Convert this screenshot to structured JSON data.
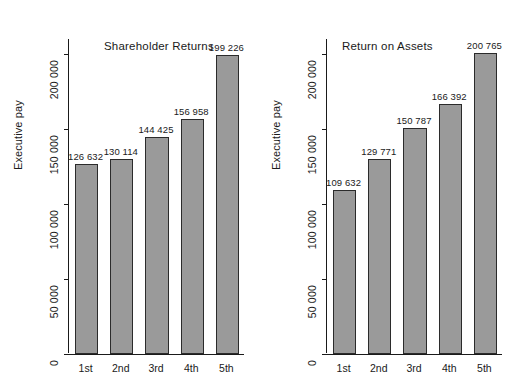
{
  "figure": {
    "supertitle": "",
    "background": "#ffffff",
    "bar_fill": "#9a9a9a",
    "bar_border": "#2b2b2b",
    "text_color": "#1a1a1a"
  },
  "chart_data": [
    {
      "type": "bar",
      "title": "Shareholder Returns",
      "xlabel": "",
      "ylabel": "Executive pay",
      "categories": [
        "1st",
        "2nd",
        "3rd",
        "4th",
        "5th"
      ],
      "values": [
        126632,
        130114,
        144425,
        156958,
        199226
      ],
      "value_labels": [
        "126 632",
        "130 114",
        "144 425",
        "156 958",
        "199 226"
      ],
      "ylim": [
        0,
        210000
      ],
      "yticks": [
        0,
        50000,
        100000,
        150000,
        200000
      ],
      "ytick_labels": [
        "0",
        "50 000",
        "100 000",
        "150 000",
        "200 000"
      ],
      "grid": false,
      "legend": "none"
    },
    {
      "type": "bar",
      "title": "Return on Assets",
      "xlabel": "",
      "ylabel": "Executive pay",
      "categories": [
        "1st",
        "2nd",
        "3rd",
        "4th",
        "5th"
      ],
      "values": [
        109632,
        129771,
        150787,
        166392,
        200765
      ],
      "value_labels": [
        "109 632",
        "129 771",
        "150 787",
        "166 392",
        "200 765"
      ],
      "ylim": [
        0,
        210000
      ],
      "yticks": [
        0,
        50000,
        100000,
        150000,
        200000
      ],
      "ytick_labels": [
        "0",
        "50 000",
        "100 000",
        "150 000",
        "200 000"
      ],
      "grid": false,
      "legend": "none"
    }
  ]
}
